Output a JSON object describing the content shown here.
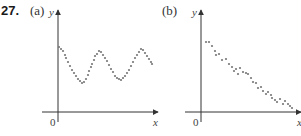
{
  "problem_number": "27.",
  "chart_data": [
    {
      "type": "scatter",
      "panel_label": "(a)",
      "title": "",
      "xlabel": "x",
      "ylabel": "y",
      "origin_label": "0",
      "grid": false,
      "legend": null,
      "description": "Oscillating (sinusoidal) pattern of points; no axis tick values",
      "points_px": [
        [
          59,
          47
        ],
        [
          61,
          49
        ],
        [
          63,
          51
        ],
        [
          65,
          55
        ],
        [
          66,
          58
        ],
        [
          68,
          62
        ],
        [
          70,
          66
        ],
        [
          72,
          70
        ],
        [
          74,
          73
        ],
        [
          76,
          76
        ],
        [
          78,
          79
        ],
        [
          80,
          81
        ],
        [
          82,
          83
        ],
        [
          84,
          82
        ],
        [
          86,
          79
        ],
        [
          88,
          75
        ],
        [
          89,
          71
        ],
        [
          91,
          67
        ],
        [
          92,
          64
        ],
        [
          94,
          60
        ],
        [
          95,
          56
        ],
        [
          97,
          54
        ],
        [
          99,
          51
        ],
        [
          101,
          52
        ],
        [
          103,
          55
        ],
        [
          105,
          58
        ],
        [
          107,
          61
        ],
        [
          109,
          65
        ],
        [
          111,
          69
        ],
        [
          113,
          72
        ],
        [
          115,
          76
        ],
        [
          117,
          78
        ],
        [
          119,
          79
        ],
        [
          121,
          80
        ],
        [
          123,
          78
        ],
        [
          125,
          76
        ],
        [
          127,
          73
        ],
        [
          129,
          70
        ],
        [
          131,
          66
        ],
        [
          133,
          62
        ],
        [
          135,
          58
        ],
        [
          137,
          55
        ],
        [
          139,
          52
        ],
        [
          141,
          49
        ],
        [
          143,
          50
        ],
        [
          145,
          53
        ],
        [
          147,
          56
        ],
        [
          149,
          59
        ],
        [
          151,
          62
        ],
        [
          152,
          64
        ]
      ]
    },
    {
      "type": "scatter",
      "panel_label": "(b)",
      "title": "",
      "xlabel": "x",
      "ylabel": "y",
      "origin_label": "0",
      "grid": false,
      "legend": null,
      "description": "Points decreasing roughly linearly (negative correlation); no axis tick values",
      "points_px": [
        [
          206,
          42
        ],
        [
          209,
          42
        ],
        [
          212,
          46
        ],
        [
          215,
          51
        ],
        [
          216,
          55
        ],
        [
          219,
          54
        ],
        [
          222,
          60
        ],
        [
          226,
          59
        ],
        [
          229,
          64
        ],
        [
          232,
          67
        ],
        [
          234,
          71
        ],
        [
          236,
          69
        ],
        [
          238,
          74
        ],
        [
          240,
          68
        ],
        [
          243,
          72
        ],
        [
          246,
          73
        ],
        [
          248,
          74
        ],
        [
          251,
          78
        ],
        [
          253,
          82
        ],
        [
          256,
          83
        ],
        [
          258,
          88
        ],
        [
          261,
          87
        ],
        [
          263,
          91
        ],
        [
          266,
          94
        ],
        [
          268,
          92
        ],
        [
          271,
          95
        ],
        [
          272,
          98
        ],
        [
          275,
          100
        ],
        [
          277,
          102
        ],
        [
          280,
          99
        ],
        [
          283,
          104
        ],
        [
          285,
          101
        ],
        [
          288,
          104
        ],
        [
          290,
          106
        ],
        [
          292,
          108
        ]
      ]
    }
  ]
}
